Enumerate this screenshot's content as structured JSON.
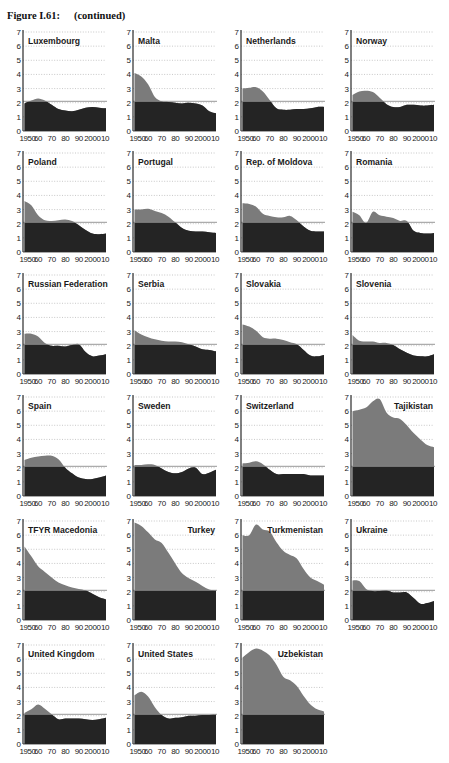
{
  "figure": {
    "title": "Figure I.61:",
    "subtitle": "(continued)"
  },
  "colors": {
    "above_replacement": "#7b7b7b",
    "below_replacement": "#242424",
    "reference_line": "#8c8c8c",
    "grid": "#b0b0b0",
    "axis": "#2a2a2a"
  },
  "chart_data": [
    {
      "type": "area",
      "title": "Luxembourg",
      "label_align": "left",
      "x": [
        1950,
        1955,
        1960,
        1965,
        1970,
        1975,
        1980,
        1985,
        1990,
        1995,
        2000,
        2005,
        2010
      ],
      "values": [
        1.95,
        2.15,
        2.3,
        2.15,
        1.85,
        1.55,
        1.45,
        1.4,
        1.5,
        1.65,
        1.7,
        1.65,
        1.6
      ],
      "ylim": [
        0,
        7
      ],
      "yticks": [
        0,
        1,
        2,
        3,
        4,
        5,
        6,
        7
      ],
      "xtick_labels": [
        "1950",
        "60",
        "70",
        "80",
        "90",
        "2000",
        "10"
      ],
      "reference_line": 2.1
    },
    {
      "type": "area",
      "title": "Malta",
      "label_align": "left",
      "x": [
        1950,
        1955,
        1960,
        1965,
        1970,
        1975,
        1980,
        1985,
        1990,
        1995,
        2000,
        2005,
        2010
      ],
      "values": [
        4.1,
        3.85,
        3.3,
        2.4,
        2.1,
        2.05,
        2.0,
        1.95,
        2.0,
        1.95,
        1.8,
        1.4,
        1.25
      ],
      "ylim": [
        0,
        7
      ],
      "yticks": [
        0,
        1,
        2,
        3,
        4,
        5,
        6,
        7
      ],
      "xtick_labels": [
        "1950",
        "60",
        "70",
        "80",
        "90",
        "2000",
        "10"
      ],
      "reference_line": 2.1
    },
    {
      "type": "area",
      "title": "Netherlands",
      "label_align": "left",
      "x": [
        1950,
        1955,
        1960,
        1965,
        1970,
        1975,
        1980,
        1985,
        1990,
        1995,
        2000,
        2005,
        2010
      ],
      "values": [
        3.0,
        3.05,
        3.1,
        2.8,
        2.2,
        1.6,
        1.5,
        1.5,
        1.55,
        1.55,
        1.6,
        1.7,
        1.7
      ],
      "ylim": [
        0,
        7
      ],
      "yticks": [
        0,
        1,
        2,
        3,
        4,
        5,
        6,
        7
      ],
      "xtick_labels": [
        "1950",
        "60",
        "70",
        "80",
        "90",
        "2000",
        "10"
      ],
      "reference_line": 2.1
    },
    {
      "type": "area",
      "title": "Norway",
      "label_align": "left",
      "x": [
        1950,
        1955,
        1960,
        1965,
        1970,
        1975,
        1980,
        1985,
        1990,
        1995,
        2000,
        2005,
        2010
      ],
      "values": [
        2.55,
        2.8,
        2.85,
        2.75,
        2.35,
        1.9,
        1.7,
        1.7,
        1.85,
        1.85,
        1.8,
        1.8,
        1.85
      ],
      "ylim": [
        0,
        7
      ],
      "yticks": [
        0,
        1,
        2,
        3,
        4,
        5,
        6,
        7
      ],
      "xtick_labels": [
        "1950",
        "60",
        "70",
        "80",
        "90",
        "2000",
        "10"
      ],
      "reference_line": 2.1
    },
    {
      "type": "area",
      "title": "Poland",
      "label_align": "left",
      "x": [
        1950,
        1955,
        1960,
        1965,
        1970,
        1975,
        1980,
        1985,
        1990,
        1995,
        2000,
        2005,
        2010
      ],
      "values": [
        3.6,
        3.3,
        2.6,
        2.25,
        2.2,
        2.25,
        2.3,
        2.2,
        1.9,
        1.55,
        1.3,
        1.25,
        1.3
      ],
      "ylim": [
        0,
        7
      ],
      "yticks": [
        0,
        1,
        2,
        3,
        4,
        5,
        6,
        7
      ],
      "xtick_labels": [
        "1950",
        "60",
        "70",
        "80",
        "90",
        "2000",
        "10"
      ],
      "reference_line": 2.1
    },
    {
      "type": "area",
      "title": "Portugal",
      "label_align": "left",
      "x": [
        1950,
        1955,
        1960,
        1965,
        1970,
        1975,
        1980,
        1985,
        1990,
        1995,
        2000,
        2005,
        2010
      ],
      "values": [
        3.0,
        3.0,
        3.05,
        2.9,
        2.75,
        2.5,
        2.1,
        1.7,
        1.5,
        1.45,
        1.45,
        1.4,
        1.35
      ],
      "ylim": [
        0,
        7
      ],
      "yticks": [
        0,
        1,
        2,
        3,
        4,
        5,
        6,
        7
      ],
      "xtick_labels": [
        "1950",
        "60",
        "70",
        "80",
        "90",
        "2000",
        "10"
      ],
      "reference_line": 2.1
    },
    {
      "type": "area",
      "title": "Rep. of Moldova",
      "label_align": "left",
      "x": [
        1950,
        1955,
        1960,
        1965,
        1970,
        1975,
        1980,
        1985,
        1990,
        1995,
        2000,
        2005,
        2010
      ],
      "values": [
        3.45,
        3.4,
        3.2,
        2.7,
        2.55,
        2.45,
        2.45,
        2.55,
        2.25,
        1.8,
        1.5,
        1.45,
        1.45
      ],
      "ylim": [
        0,
        7
      ],
      "yticks": [
        0,
        1,
        2,
        3,
        4,
        5,
        6,
        7
      ],
      "xtick_labels": [
        "1950",
        "60",
        "70",
        "80",
        "90",
        "2000",
        "10"
      ],
      "reference_line": 2.1
    },
    {
      "type": "area",
      "title": "Romania",
      "label_align": "left",
      "x": [
        1950,
        1955,
        1960,
        1965,
        1970,
        1975,
        1980,
        1985,
        1990,
        1995,
        2000,
        2005,
        2010
      ],
      "values": [
        2.85,
        2.6,
        2.05,
        2.85,
        2.6,
        2.5,
        2.4,
        2.2,
        2.2,
        1.5,
        1.35,
        1.3,
        1.35
      ],
      "ylim": [
        0,
        7
      ],
      "yticks": [
        0,
        1,
        2,
        3,
        4,
        5,
        6,
        7
      ],
      "xtick_labels": [
        "1950",
        "60",
        "70",
        "80",
        "90",
        "2000",
        "10"
      ],
      "reference_line": 2.1
    },
    {
      "type": "area",
      "title": "Russian Federation",
      "label_align": "left",
      "x": [
        1950,
        1955,
        1960,
        1965,
        1970,
        1975,
        1980,
        1985,
        1990,
        1995,
        2000,
        2005,
        2010
      ],
      "values": [
        2.85,
        2.85,
        2.65,
        2.2,
        2.0,
        2.0,
        1.95,
        2.05,
        2.1,
        1.55,
        1.25,
        1.3,
        1.4
      ],
      "ylim": [
        0,
        7
      ],
      "yticks": [
        0,
        1,
        2,
        3,
        4,
        5,
        6,
        7
      ],
      "xtick_labels": [
        "1950",
        "60",
        "70",
        "80",
        "90",
        "2000",
        "10"
      ],
      "reference_line": 2.1
    },
    {
      "type": "area",
      "title": "Serbia",
      "label_align": "left",
      "x": [
        1950,
        1955,
        1960,
        1965,
        1970,
        1975,
        1980,
        1985,
        1990,
        1995,
        2000,
        2005,
        2010
      ],
      "values": [
        3.1,
        2.8,
        2.6,
        2.45,
        2.35,
        2.3,
        2.3,
        2.25,
        2.1,
        1.95,
        1.75,
        1.7,
        1.6
      ],
      "ylim": [
        0,
        7
      ],
      "yticks": [
        0,
        1,
        2,
        3,
        4,
        5,
        6,
        7
      ],
      "xtick_labels": [
        "1950",
        "60",
        "70",
        "80",
        "90",
        "2000",
        "10"
      ],
      "reference_line": 2.1
    },
    {
      "type": "area",
      "title": "Slovakia",
      "label_align": "left",
      "x": [
        1950,
        1955,
        1960,
        1965,
        1970,
        1975,
        1980,
        1985,
        1990,
        1995,
        2000,
        2005,
        2010
      ],
      "values": [
        3.5,
        3.35,
        3.05,
        2.6,
        2.5,
        2.5,
        2.4,
        2.25,
        2.1,
        1.7,
        1.3,
        1.25,
        1.35
      ],
      "ylim": [
        0,
        7
      ],
      "yticks": [
        0,
        1,
        2,
        3,
        4,
        5,
        6,
        7
      ],
      "xtick_labels": [
        "1950",
        "60",
        "70",
        "80",
        "90",
        "2000",
        "10"
      ],
      "reference_line": 2.1
    },
    {
      "type": "area",
      "title": "Slovenia",
      "label_align": "left",
      "x": [
        1950,
        1955,
        1960,
        1965,
        1970,
        1975,
        1980,
        1985,
        1990,
        1995,
        2000,
        2005,
        2010
      ],
      "values": [
        2.75,
        2.35,
        2.3,
        2.3,
        2.2,
        2.2,
        2.05,
        1.75,
        1.5,
        1.3,
        1.25,
        1.25,
        1.4
      ],
      "ylim": [
        0,
        7
      ],
      "yticks": [
        0,
        1,
        2,
        3,
        4,
        5,
        6,
        7
      ],
      "xtick_labels": [
        "1950",
        "60",
        "70",
        "80",
        "90",
        "2000",
        "10"
      ],
      "reference_line": 2.1
    },
    {
      "type": "area",
      "title": "Spain",
      "label_align": "left",
      "x": [
        1950,
        1955,
        1960,
        1965,
        1970,
        1975,
        1980,
        1985,
        1990,
        1995,
        2000,
        2005,
        2010
      ],
      "values": [
        2.55,
        2.7,
        2.8,
        2.85,
        2.85,
        2.6,
        2.0,
        1.6,
        1.3,
        1.2,
        1.2,
        1.3,
        1.45
      ],
      "ylim": [
        0,
        7
      ],
      "yticks": [
        0,
        1,
        2,
        3,
        4,
        5,
        6,
        7
      ],
      "xtick_labels": [
        "1950",
        "60",
        "70",
        "80",
        "90",
        "2000",
        "10"
      ],
      "reference_line": 2.1
    },
    {
      "type": "area",
      "title": "Sweden",
      "label_align": "left",
      "x": [
        1950,
        1955,
        1960,
        1965,
        1970,
        1975,
        1980,
        1985,
        1990,
        1995,
        2000,
        2005,
        2010
      ],
      "values": [
        2.2,
        2.2,
        2.25,
        2.2,
        1.95,
        1.7,
        1.6,
        1.7,
        1.95,
        2.0,
        1.55,
        1.65,
        1.85
      ],
      "ylim": [
        0,
        7
      ],
      "yticks": [
        0,
        1,
        2,
        3,
        4,
        5,
        6,
        7
      ],
      "xtick_labels": [
        "1950",
        "60",
        "70",
        "80",
        "90",
        "2000",
        "10"
      ],
      "reference_line": 2.1
    },
    {
      "type": "area",
      "title": "Switzerland",
      "label_align": "left",
      "x": [
        1950,
        1955,
        1960,
        1965,
        1970,
        1975,
        1980,
        1985,
        1990,
        1995,
        2000,
        2005,
        2010
      ],
      "values": [
        2.3,
        2.35,
        2.45,
        2.25,
        1.85,
        1.55,
        1.55,
        1.55,
        1.55,
        1.55,
        1.45,
        1.45,
        1.45
      ],
      "ylim": [
        0,
        7
      ],
      "yticks": [
        0,
        1,
        2,
        3,
        4,
        5,
        6,
        7
      ],
      "xtick_labels": [
        "1950",
        "60",
        "70",
        "80",
        "90",
        "2000",
        "10"
      ],
      "reference_line": 2.1
    },
    {
      "type": "area",
      "title": "Tajikistan",
      "label_align": "right",
      "x": [
        1950,
        1955,
        1960,
        1965,
        1970,
        1975,
        1980,
        1985,
        1990,
        1995,
        2000,
        2005,
        2010
      ],
      "values": [
        6.0,
        6.1,
        6.25,
        6.7,
        6.85,
        5.9,
        5.55,
        5.45,
        5.0,
        4.45,
        4.0,
        3.6,
        3.45
      ],
      "ylim": [
        0,
        7
      ],
      "yticks": [
        0,
        1,
        2,
        3,
        4,
        5,
        6,
        7
      ],
      "xtick_labels": [
        "1950",
        "60",
        "70",
        "80",
        "90",
        "2000",
        "10"
      ],
      "reference_line": 2.1
    },
    {
      "type": "area",
      "title": "TFYR Macedonia",
      "label_align": "left",
      "x": [
        1950,
        1955,
        1960,
        1965,
        1970,
        1975,
        1980,
        1985,
        1990,
        1995,
        2000,
        2005,
        2010
      ],
      "values": [
        5.2,
        4.5,
        3.8,
        3.4,
        3.0,
        2.65,
        2.45,
        2.3,
        2.2,
        2.1,
        1.85,
        1.6,
        1.45
      ],
      "ylim": [
        0,
        7
      ],
      "yticks": [
        0,
        1,
        2,
        3,
        4,
        5,
        6,
        7
      ],
      "xtick_labels": [
        "1950",
        "60",
        "70",
        "80",
        "90",
        "2000",
        "10"
      ],
      "reference_line": 2.1
    },
    {
      "type": "area",
      "title": "Turkey",
      "label_align": "right",
      "x": [
        1950,
        1955,
        1960,
        1965,
        1970,
        1975,
        1980,
        1985,
        1990,
        1995,
        2000,
        2005,
        2010
      ],
      "values": [
        6.9,
        6.65,
        6.2,
        5.7,
        5.45,
        4.75,
        4.0,
        3.3,
        2.95,
        2.7,
        2.4,
        2.15,
        2.1
      ],
      "ylim": [
        0,
        7
      ],
      "yticks": [
        0,
        1,
        2,
        3,
        4,
        5,
        6,
        7
      ],
      "xtick_labels": [
        "1950",
        "60",
        "70",
        "80",
        "90",
        "2000",
        "10"
      ],
      "reference_line": 2.1
    },
    {
      "type": "area",
      "title": "Turkmenistan",
      "label_align": "right",
      "x": [
        1950,
        1955,
        1960,
        1965,
        1970,
        1975,
        1980,
        1985,
        1990,
        1995,
        2000,
        2005,
        2010
      ],
      "values": [
        6.0,
        6.0,
        6.75,
        6.4,
        6.25,
        5.5,
        4.9,
        4.6,
        4.35,
        3.6,
        3.0,
        2.75,
        2.5
      ],
      "ylim": [
        0,
        7
      ],
      "yticks": [
        0,
        1,
        2,
        3,
        4,
        5,
        6,
        7
      ],
      "xtick_labels": [
        "1950",
        "60",
        "70",
        "80",
        "90",
        "2000",
        "10"
      ],
      "reference_line": 2.1
    },
    {
      "type": "area",
      "title": "Ukraine",
      "label_align": "left",
      "x": [
        1950,
        1955,
        1960,
        1965,
        1970,
        1975,
        1980,
        1985,
        1990,
        1995,
        2000,
        2005,
        2010
      ],
      "values": [
        2.8,
        2.75,
        2.2,
        2.05,
        2.05,
        2.1,
        1.95,
        1.95,
        1.95,
        1.55,
        1.15,
        1.2,
        1.35
      ],
      "ylim": [
        0,
        7
      ],
      "yticks": [
        0,
        1,
        2,
        3,
        4,
        5,
        6,
        7
      ],
      "xtick_labels": [
        "1950",
        "60",
        "70",
        "80",
        "90",
        "2000",
        "10"
      ],
      "reference_line": 2.1
    },
    {
      "type": "area",
      "title": "United Kingdom",
      "label_align": "left",
      "x": [
        1950,
        1955,
        1960,
        1965,
        1970,
        1975,
        1980,
        1985,
        1990,
        1995,
        2000,
        2005,
        2010
      ],
      "values": [
        2.2,
        2.45,
        2.8,
        2.5,
        2.1,
        1.75,
        1.8,
        1.8,
        1.8,
        1.75,
        1.7,
        1.75,
        1.85
      ],
      "ylim": [
        0,
        7
      ],
      "yticks": [
        0,
        1,
        2,
        3,
        4,
        5,
        6,
        7
      ],
      "xtick_labels": [
        "1950",
        "60",
        "70",
        "80",
        "90",
        "2000",
        "10"
      ],
      "reference_line": 2.1
    },
    {
      "type": "area",
      "title": "United States",
      "label_align": "left",
      "x": [
        1950,
        1955,
        1960,
        1965,
        1970,
        1975,
        1980,
        1985,
        1990,
        1995,
        2000,
        2005,
        2010
      ],
      "values": [
        3.45,
        3.7,
        3.35,
        2.6,
        2.05,
        1.8,
        1.85,
        1.9,
        2.0,
        2.0,
        2.05,
        2.05,
        2.1
      ],
      "ylim": [
        0,
        7
      ],
      "yticks": [
        0,
        1,
        2,
        3,
        4,
        5,
        6,
        7
      ],
      "xtick_labels": [
        "1950",
        "60",
        "70",
        "80",
        "90",
        "2000",
        "10"
      ],
      "reference_line": 2.1
    },
    {
      "type": "area",
      "title": "Uzbekistan",
      "label_align": "right",
      "x": [
        1950,
        1955,
        1960,
        1965,
        1970,
        1975,
        1980,
        1985,
        1990,
        1995,
        2000,
        2005,
        2010
      ],
      "values": [
        6.1,
        6.5,
        6.75,
        6.6,
        6.25,
        5.6,
        4.75,
        4.5,
        4.1,
        3.4,
        2.8,
        2.45,
        2.3
      ],
      "ylim": [
        0,
        7
      ],
      "yticks": [
        0,
        1,
        2,
        3,
        4,
        5,
        6,
        7
      ],
      "xtick_labels": [
        "1950",
        "60",
        "70",
        "80",
        "90",
        "2000",
        "10"
      ],
      "reference_line": 2.1
    }
  ]
}
